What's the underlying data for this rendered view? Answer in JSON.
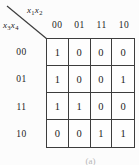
{
  "kmap": {
    "col_var_label": {
      "v1": "x",
      "s1": "1",
      "v2": "x",
      "s2": "2"
    },
    "row_var_label": {
      "v1": "x",
      "s1": "3",
      "v2": "x",
      "s2": "4"
    },
    "col_headers": [
      "00",
      "01",
      "11",
      "10"
    ],
    "row_headers": [
      "00",
      "01",
      "11",
      "10"
    ],
    "rows": [
      [
        "1",
        "0",
        "0",
        "0"
      ],
      [
        "1",
        "0",
        "0",
        "1"
      ],
      [
        "1",
        "1",
        "0",
        "0"
      ],
      [
        "0",
        "0",
        "1",
        "1"
      ]
    ],
    "caption": "(a)",
    "colors": {
      "ink": "#232323",
      "line": "#3d3d3d",
      "background": "#fcfcfc"
    }
  }
}
